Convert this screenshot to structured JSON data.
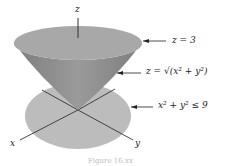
{
  "diagram": {
    "axis_labels": {
      "z": "z",
      "x": "x",
      "y": "y"
    },
    "annotations": [
      {
        "id": "top",
        "text": "z = 3"
      },
      {
        "id": "cone",
        "text": "z = √(x² + y²)"
      },
      {
        "id": "disk",
        "text": "x² + y² ≤ 9"
      }
    ],
    "caption": "Figure 16.xx",
    "colors": {
      "cone_top": "#a9a9a9",
      "cone_side": "#8c8c8c",
      "disk": "#bdbdbd",
      "axes": "#333333"
    }
  }
}
